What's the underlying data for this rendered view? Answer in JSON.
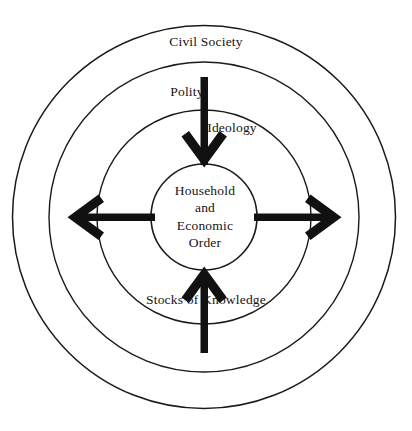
{
  "diagram": {
    "background_color": "#ffffff",
    "stroke_color": "#1a1a1a",
    "arrow_color": "#111111",
    "center": {
      "x": 204,
      "y": 217
    },
    "rings": [
      {
        "name": "civil-society",
        "label": "Civil Society",
        "radius": 192
      },
      {
        "name": "polity",
        "label": "Polity",
        "radius": 155
      },
      {
        "name": "ideology",
        "label": "Ideology",
        "radius": 107
      },
      {
        "name": "household-economic-order",
        "label": "Household and Economic Order",
        "radius": 53
      }
    ],
    "center_label": {
      "line1": "Household",
      "line2": "and",
      "line3": "Economic",
      "line4": "Order"
    },
    "bottom_label": "Stocks of  Knowledge",
    "arrows": [
      {
        "name": "arrow-down-top",
        "direction": "down",
        "points_to": "center"
      },
      {
        "name": "arrow-up-bottom",
        "direction": "up",
        "points_to": "center"
      },
      {
        "name": "arrow-left",
        "direction": "left",
        "points_to": "outward"
      },
      {
        "name": "arrow-right",
        "direction": "right",
        "points_to": "outward"
      }
    ]
  }
}
